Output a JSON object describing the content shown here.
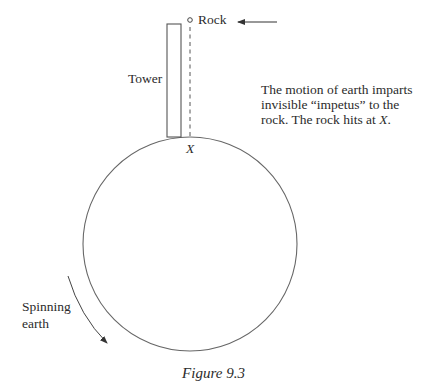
{
  "figure": {
    "caption": "Figure 9.3",
    "labels": {
      "rock": "Rock",
      "tower": "Tower",
      "impact_point": "X",
      "explanation_line1": "The motion of earth imparts",
      "explanation_line2": "invisible “impetus” to the",
      "explanation_line3_prefix": "rock. The rock hits at ",
      "explanation_line3_italic": "X",
      "explanation_line3_suffix": ".",
      "spin_line1": "Spinning",
      "spin_line2": "earth"
    },
    "elements": {
      "earth_circle": {
        "cx": 190,
        "cy": 244,
        "r": 107
      },
      "tower": {
        "x": 167,
        "y": 24,
        "width": 14,
        "height": 113
      },
      "fall_path": {
        "x": 190,
        "y1": 27,
        "y2": 137,
        "style": "dashed"
      },
      "rock_marker": {
        "cx": 190,
        "cy": 20,
        "r": 2.5
      },
      "motion_arrow": {
        "x1": 277,
        "x2": 237,
        "y": 22,
        "direction": "left"
      },
      "spin_arrow": {
        "direction": "counterclockwise-downward"
      }
    },
    "colors": {
      "line": "#555555",
      "text": "#2b2b2b",
      "background": "#ffffff"
    }
  }
}
